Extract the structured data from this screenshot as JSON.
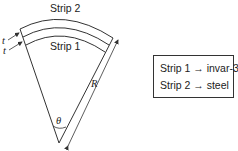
{
  "diagram": {
    "labels": {
      "strip2": "Strip 2",
      "strip1": "Strip 1",
      "thickness_top": "t",
      "thickness_bottom": "t",
      "radius": "R",
      "angle": "θ"
    },
    "legend": {
      "items": [
        {
          "text": "Strip 1 → invar-36"
        },
        {
          "text": "Strip 2 → steel"
        }
      ]
    },
    "colors": {
      "line": "#333333",
      "text": "#222222",
      "background": "#ffffff"
    }
  }
}
